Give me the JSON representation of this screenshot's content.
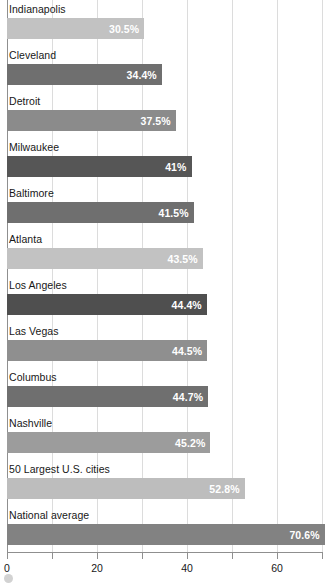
{
  "chart_data": {
    "type": "bar",
    "orientation": "horizontal",
    "title": "",
    "subtitle": "",
    "xlabel": "",
    "ylabel": "",
    "xlim": [
      0,
      70
    ],
    "grid": true,
    "legend": "none",
    "categories": [
      "Indianapolis",
      "Cleveland",
      "Detroit",
      "Milwaukee",
      "Baltimore",
      "Atlanta",
      "Los Angeles",
      "Las Vegas",
      "Columbus",
      "Nashville",
      "50 Largest U.S. cities",
      "National average"
    ],
    "values": [
      30.5,
      34.4,
      37.5,
      41,
      41.5,
      43.5,
      44.4,
      44.5,
      44.7,
      45.2,
      52.8,
      70.6
    ],
    "value_labels": [
      "30.5%",
      "34.4%",
      "37.5%",
      "41%",
      "41.5%",
      "43.5%",
      "44.4%",
      "44.5%",
      "44.7%",
      "45.2%",
      "52.8%",
      "70.6%"
    ],
    "bar_colors": [
      "#c2c2c2",
      "#6f6f6f",
      "#8b8b8b",
      "#565656",
      "#6f6f6f",
      "#c2c2c2",
      "#4f4f4f",
      "#8f8f8f",
      "#6f6f6f",
      "#9c9c9c",
      "#bdbdbd",
      "#828282"
    ],
    "xticks": [
      0,
      10,
      20,
      30,
      40,
      50,
      60,
      70
    ],
    "xtick_labels": [
      "0",
      "",
      "20",
      "",
      "40",
      "",
      "60",
      ""
    ],
    "gridline_color": "#dcdcdc",
    "axis_color": "#8f8f8f",
    "label_color": "#171717",
    "value_label_color": "#ffffff"
  }
}
